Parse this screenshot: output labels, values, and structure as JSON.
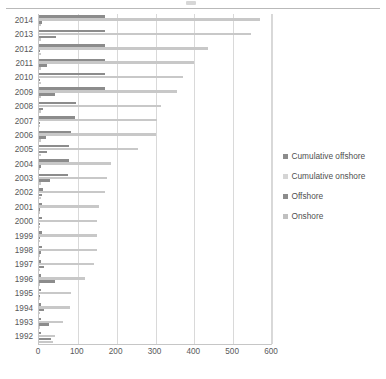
{
  "chart_data": {
    "type": "bar",
    "orientation": "horizontal",
    "title": "",
    "xlabel": "",
    "ylabel": "",
    "xlim": [
      0,
      600
    ],
    "xticks": [
      0,
      100,
      200,
      300,
      400,
      500,
      600
    ],
    "grid": true,
    "legend_position": "right",
    "categories": [
      "2014",
      "2013",
      "2012",
      "2011",
      "2010",
      "2009",
      "2008",
      "2007",
      "2006",
      "2005",
      "2004",
      "2003",
      "2002",
      "2001",
      "2000",
      "1999",
      "1998",
      "1997",
      "1996",
      "1995",
      "1994",
      "1993",
      "1992"
    ],
    "series": [
      {
        "name": "Cumulative offshore",
        "color": "#8c8c8c",
        "values": [
          170,
          170,
          170,
          170,
          170,
          170,
          95,
          92,
          83,
          78,
          76,
          74,
          10,
          8,
          7,
          7,
          7,
          6,
          6,
          5,
          5,
          4,
          4
        ]
      },
      {
        "name": "Cumulative onshore",
        "color": "#c8c8c8",
        "values": [
          570,
          545,
          435,
          400,
          370,
          355,
          315,
          305,
          300,
          255,
          185,
          175,
          170,
          155,
          150,
          150,
          150,
          142,
          118,
          82,
          80,
          63,
          40
        ]
      },
      {
        "name": "Offshore",
        "color": "#8c8c8c",
        "values": [
          8,
          43,
          3,
          20,
          3,
          42,
          10,
          2,
          18,
          20,
          4,
          28,
          7,
          2,
          2,
          2,
          6,
          14,
          40,
          3,
          12,
          25,
          30
        ]
      },
      {
        "name": "Onshore",
        "color": "#c8c8c8",
        "values": [
          4,
          6,
          4,
          6,
          4,
          5,
          4,
          3,
          4,
          4,
          3,
          4,
          4,
          3,
          3,
          3,
          3,
          3,
          3,
          3,
          3,
          3,
          36
        ]
      }
    ]
  },
  "legend": {
    "items": [
      {
        "label": "Cumulative offshore"
      },
      {
        "label": "Cumulative onshore"
      },
      {
        "label": "Offshore"
      },
      {
        "label": "Onshore"
      }
    ]
  }
}
